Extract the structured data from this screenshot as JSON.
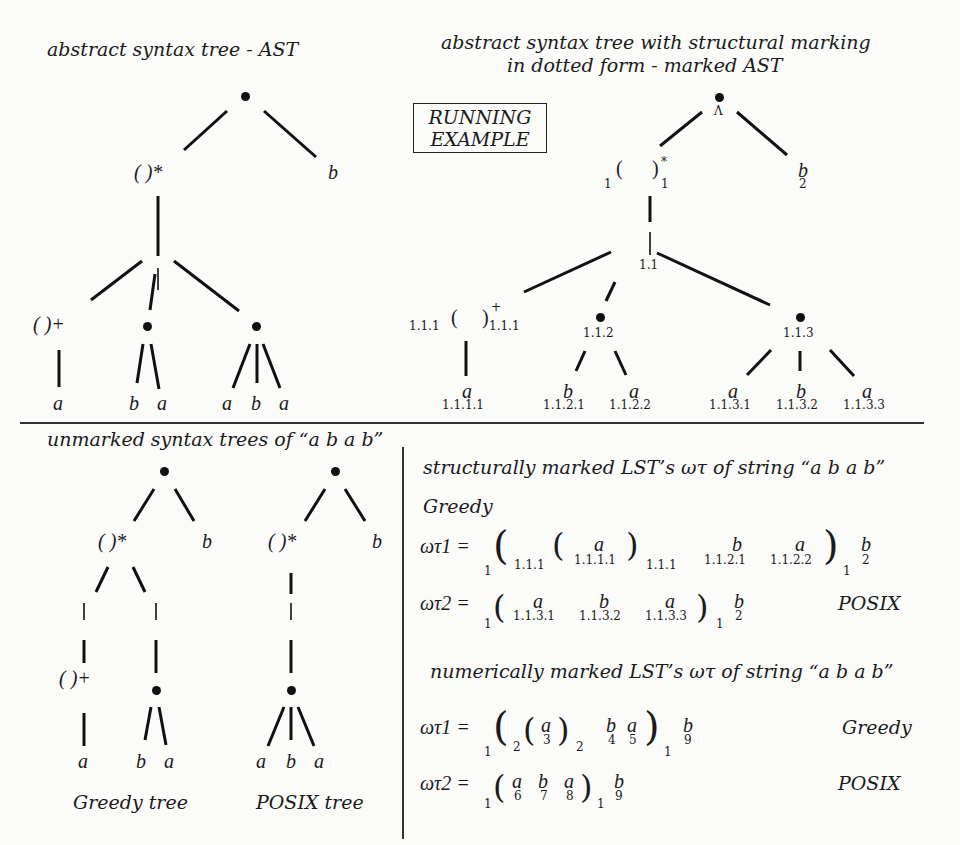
{
  "top_left": {
    "title": "abstract syntax tree - AST",
    "nodes": {
      "root": "•",
      "star": "( )*",
      "b": "b",
      "plus": "( )+",
      "leaves": [
        "a",
        "b",
        "a",
        "a",
        "b",
        "a"
      ]
    }
  },
  "running_example": {
    "line1": "RUNNING",
    "line2": "EXAMPLE"
  },
  "top_right": {
    "title_line1": "abstract syntax tree with structural marking",
    "title_line2": "in dotted form - marked AST",
    "root_mark": "Λ",
    "star_left_mark": "1",
    "star_right_mark": "1",
    "b": "b",
    "b_mark": "2",
    "mid_mark": "1.1",
    "plus_left_mark": "1.1.1",
    "plus_right_mark": "1.1.1",
    "node2_mark": "1.1.2",
    "node3_mark": "1.1.3",
    "leaves": [
      {
        "sym": "a",
        "mark": "1.1.1.1"
      },
      {
        "sym": "b",
        "mark": "1.1.2.1"
      },
      {
        "sym": "a",
        "mark": "1.1.2.2"
      },
      {
        "sym": "a",
        "mark": "1.1.3.1"
      },
      {
        "sym": "b",
        "mark": "1.1.3.2"
      },
      {
        "sym": "a",
        "mark": "1.1.3.3"
      }
    ]
  },
  "bottom_left": {
    "title": "unmarked syntax trees of “a b a b”",
    "greedy": {
      "star": "( )*",
      "b": "b",
      "plus": "( )+",
      "leaves": [
        "a",
        "b",
        "a"
      ],
      "caption": "Greedy tree"
    },
    "posix": {
      "star": "( )*",
      "b": "b",
      "leaves": [
        "a",
        "b",
        "a"
      ],
      "caption": "POSIX tree"
    }
  },
  "bottom_right": {
    "structural_title": "structurally marked LST’s ωτ of string “a b a b”",
    "greedy_label": "Greedy",
    "s1": {
      "lhs": "ωτ1 =",
      "outer_open": "1",
      "inner_open": "1.1.1",
      "a1": "a",
      "a1_mark": "1.1.1.1",
      "inner_close": "1.1.1",
      "b1": "b",
      "b1_mark": "1.1.2.1",
      "a2": "a",
      "a2_mark": "1.1.2.2",
      "outer_close": "1",
      "b2": "b",
      "b2_mark": "2"
    },
    "s2": {
      "lhs": "ωτ2 =",
      "outer_open": "1",
      "a1": "a",
      "a1_mark": "1.1.3.1",
      "b1": "b",
      "b1_mark": "1.1.3.2",
      "a2": "a",
      "a2_mark": "1.1.3.3",
      "outer_close": "1",
      "b2": "b",
      "b2_mark": "2",
      "label": "POSIX"
    },
    "numeric_title": "numerically marked LST’s ωτ of string “a b a b”",
    "n1": {
      "lhs": "ωτ1 =",
      "outer_open": "1",
      "inner_open": "2",
      "a1": "a",
      "a1_mark": "3",
      "inner_close": "2",
      "b1": "b",
      "b1_mark": "4",
      "a2": "a",
      "a2_mark": "5",
      "outer_close": "1",
      "b2": "b",
      "b2_mark": "9",
      "label": "Greedy"
    },
    "n2": {
      "lhs": "ωτ2 =",
      "outer_open": "1",
      "a1": "a",
      "a1_mark": "6",
      "b1": "b",
      "b1_mark": "7",
      "a2": "a",
      "a2_mark": "8",
      "outer_close": "1",
      "b2": "b",
      "b2_mark": "9",
      "label": "POSIX"
    }
  }
}
